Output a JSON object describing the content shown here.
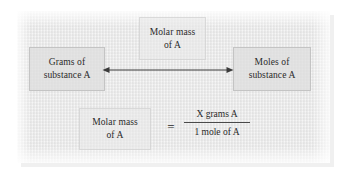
{
  "diagram": {
    "panel": {
      "background_color": "#eeeeee",
      "texture": "mottled-paper"
    },
    "text_color": "#2a2a2a",
    "boxes": {
      "top_conversion_factor": {
        "line1": "Molar mass",
        "line2": "of A"
      },
      "left_quantity": {
        "line1": "Grams of",
        "line2": "substance A"
      },
      "right_quantity": {
        "line1": "Moles of",
        "line2": "substance A"
      },
      "equation_left": {
        "line1": "Molar mass",
        "line2": "of A"
      }
    },
    "arrow": {
      "style": "double-headed-horizontal",
      "color": "#3b3b3b"
    },
    "equation": {
      "equals_sign": "=",
      "numerator": "X grams A",
      "denominator": "1 mole of A"
    }
  }
}
